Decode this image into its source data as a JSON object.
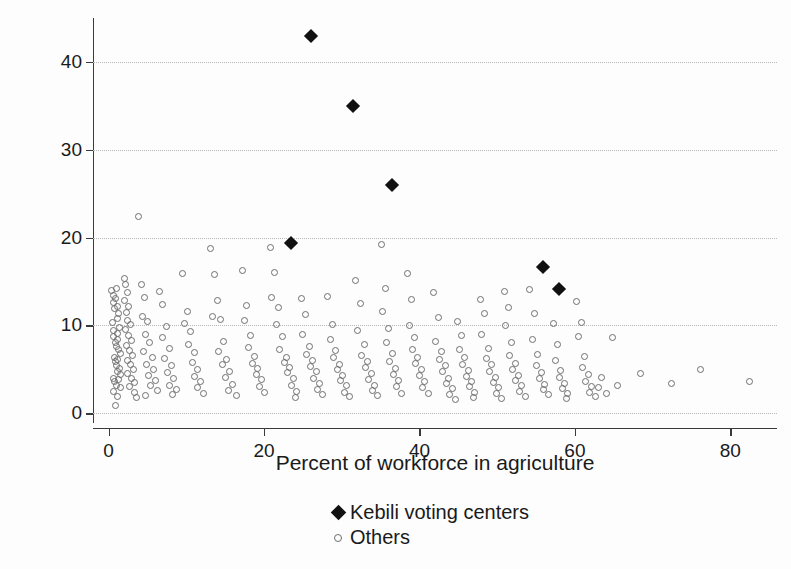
{
  "chart_data": {
    "type": "scatter",
    "title": "",
    "xlabel": "Percent of workforce in agriculture",
    "ylabel": "Percent voting for CPR",
    "xlim": [
      -2,
      86
    ],
    "ylim": [
      -1,
      45
    ],
    "xticks": [
      0,
      20,
      40,
      60,
      80
    ],
    "yticks": [
      0,
      10,
      20,
      30,
      40
    ],
    "grid": "horizontal-dotted",
    "legend_position": "bottom-center",
    "series": [
      {
        "name": "Kebili voting centers",
        "marker": "filled-diamond",
        "color": "#111111",
        "points": [
          [
            26.0,
            43.0
          ],
          [
            31.4,
            35.0
          ],
          [
            36.5,
            26.0
          ],
          [
            23.5,
            19.4
          ],
          [
            55.9,
            16.7
          ],
          [
            58.0,
            14.1
          ]
        ]
      },
      {
        "name": "Others",
        "marker": "open-circle",
        "color": "#6e6e6e",
        "points": [
          [
            3.9,
            22.4
          ],
          [
            0.4,
            14.0
          ],
          [
            0.6,
            13.4
          ],
          [
            0.7,
            12.6
          ],
          [
            0.8,
            11.9
          ],
          [
            0.9,
            13.1
          ],
          [
            1.0,
            14.2
          ],
          [
            1.1,
            12.1
          ],
          [
            1.2,
            10.8
          ],
          [
            1.3,
            11.4
          ],
          [
            1.4,
            9.8
          ],
          [
            0.5,
            10.3
          ],
          [
            0.6,
            9.4
          ],
          [
            0.7,
            8.7
          ],
          [
            0.9,
            8.1
          ],
          [
            1.0,
            7.6
          ],
          [
            1.1,
            9.1
          ],
          [
            1.2,
            8.4
          ],
          [
            1.3,
            7.2
          ],
          [
            1.5,
            6.8
          ],
          [
            0.8,
            6.4
          ],
          [
            0.9,
            5.9
          ],
          [
            1.0,
            5.4
          ],
          [
            1.1,
            6.1
          ],
          [
            1.2,
            4.8
          ],
          [
            1.4,
            5.1
          ],
          [
            1.6,
            4.4
          ],
          [
            0.6,
            4.0
          ],
          [
            0.8,
            3.6
          ],
          [
            1.0,
            3.2
          ],
          [
            1.3,
            3.8
          ],
          [
            1.5,
            2.9
          ],
          [
            0.7,
            2.5
          ],
          [
            1.1,
            1.9
          ],
          [
            0.9,
            0.9
          ],
          [
            2.0,
            15.3
          ],
          [
            2.2,
            14.6
          ],
          [
            2.4,
            13.8
          ],
          [
            2.1,
            12.8
          ],
          [
            2.6,
            12.2
          ],
          [
            2.3,
            11.5
          ],
          [
            2.5,
            10.6
          ],
          [
            2.8,
            10.1
          ],
          [
            2.2,
            9.5
          ],
          [
            2.6,
            8.9
          ],
          [
            2.9,
            8.3
          ],
          [
            2.3,
            7.7
          ],
          [
            2.7,
            7.1
          ],
          [
            3.1,
            6.6
          ],
          [
            2.4,
            6.0
          ],
          [
            2.8,
            5.5
          ],
          [
            3.2,
            5.0
          ],
          [
            2.5,
            4.5
          ],
          [
            3.0,
            4.0
          ],
          [
            3.4,
            3.5
          ],
          [
            2.7,
            3.0
          ],
          [
            3.3,
            2.4
          ],
          [
            3.6,
            1.8
          ],
          [
            4.2,
            14.6
          ],
          [
            4.6,
            13.2
          ],
          [
            4.4,
            11.0
          ],
          [
            5.0,
            10.4
          ],
          [
            4.8,
            9.0
          ],
          [
            5.3,
            8.1
          ],
          [
            4.5,
            7.0
          ],
          [
            5.6,
            6.3
          ],
          [
            4.9,
            5.6
          ],
          [
            5.8,
            5.0
          ],
          [
            5.1,
            4.3
          ],
          [
            6.0,
            3.7
          ],
          [
            5.4,
            3.1
          ],
          [
            6.3,
            2.6
          ],
          [
            4.7,
            2.0
          ],
          [
            6.6,
            13.9
          ],
          [
            7.0,
            12.4
          ],
          [
            7.4,
            9.9
          ],
          [
            6.9,
            8.6
          ],
          [
            7.8,
            7.4
          ],
          [
            7.2,
            6.2
          ],
          [
            8.1,
            5.4
          ],
          [
            7.6,
            4.6
          ],
          [
            8.4,
            3.9
          ],
          [
            7.9,
            3.2
          ],
          [
            8.8,
            2.7
          ],
          [
            8.2,
            2.1
          ],
          [
            9.5,
            15.9
          ],
          [
            10.1,
            11.6
          ],
          [
            9.8,
            10.2
          ],
          [
            10.6,
            9.3
          ],
          [
            10.3,
            7.8
          ],
          [
            11.0,
            6.9
          ],
          [
            10.8,
            5.8
          ],
          [
            11.4,
            5.0
          ],
          [
            11.1,
            4.2
          ],
          [
            11.8,
            3.6
          ],
          [
            11.5,
            2.9
          ],
          [
            12.2,
            2.3
          ],
          [
            13.1,
            18.8
          ],
          [
            13.6,
            15.8
          ],
          [
            14.0,
            12.8
          ],
          [
            13.4,
            11.0
          ],
          [
            14.4,
            10.7
          ],
          [
            14.8,
            8.2
          ],
          [
            14.2,
            7.0
          ],
          [
            15.2,
            6.1
          ],
          [
            14.6,
            5.6
          ],
          [
            15.6,
            4.8
          ],
          [
            15.0,
            4.1
          ],
          [
            16.0,
            3.3
          ],
          [
            15.4,
            2.6
          ],
          [
            16.4,
            2.0
          ],
          [
            17.2,
            16.2
          ],
          [
            17.8,
            12.3
          ],
          [
            17.5,
            10.6
          ],
          [
            18.3,
            8.9
          ],
          [
            18.0,
            7.5
          ],
          [
            18.8,
            6.5
          ],
          [
            18.5,
            5.7
          ],
          [
            19.2,
            5.1
          ],
          [
            19.0,
            4.4
          ],
          [
            19.7,
            3.8
          ],
          [
            19.4,
            3.0
          ],
          [
            20.1,
            2.4
          ],
          [
            20.8,
            18.9
          ],
          [
            21.4,
            16.0
          ],
          [
            21.0,
            13.2
          ],
          [
            21.9,
            12.0
          ],
          [
            21.6,
            10.1
          ],
          [
            22.4,
            8.7
          ],
          [
            22.0,
            7.3
          ],
          [
            22.9,
            6.4
          ],
          [
            22.6,
            5.8
          ],
          [
            23.3,
            5.2
          ],
          [
            23.0,
            4.6
          ],
          [
            23.8,
            3.9
          ],
          [
            23.5,
            3.2
          ],
          [
            24.2,
            2.5
          ],
          [
            24.0,
            1.8
          ],
          [
            24.8,
            13.1
          ],
          [
            25.3,
            11.2
          ],
          [
            25.0,
            9.0
          ],
          [
            25.8,
            7.6
          ],
          [
            25.5,
            6.7
          ],
          [
            26.2,
            6.0
          ],
          [
            26.0,
            5.3
          ],
          [
            26.7,
            4.7
          ],
          [
            26.4,
            4.0
          ],
          [
            27.1,
            3.4
          ],
          [
            26.9,
            2.7
          ],
          [
            27.5,
            2.1
          ],
          [
            28.2,
            13.3
          ],
          [
            28.8,
            10.1
          ],
          [
            28.5,
            8.4
          ],
          [
            29.2,
            7.1
          ],
          [
            29.0,
            6.3
          ],
          [
            29.7,
            5.6
          ],
          [
            29.4,
            5.0
          ],
          [
            30.1,
            4.3
          ],
          [
            29.9,
            3.7
          ],
          [
            30.6,
            3.1
          ],
          [
            30.3,
            2.4
          ],
          [
            31.0,
            1.9
          ],
          [
            31.8,
            15.1
          ],
          [
            32.4,
            12.5
          ],
          [
            32.0,
            9.4
          ],
          [
            32.9,
            7.8
          ],
          [
            32.6,
            6.6
          ],
          [
            33.3,
            5.9
          ],
          [
            33.0,
            5.2
          ],
          [
            33.8,
            4.5
          ],
          [
            33.5,
            3.8
          ],
          [
            34.2,
            3.2
          ],
          [
            33.9,
            2.6
          ],
          [
            34.6,
            2.0
          ],
          [
            35.1,
            19.2
          ],
          [
            35.6,
            14.2
          ],
          [
            35.3,
            11.6
          ],
          [
            36.0,
            9.6
          ],
          [
            35.8,
            8.0
          ],
          [
            36.5,
            6.8
          ],
          [
            36.2,
            5.9
          ],
          [
            36.9,
            5.1
          ],
          [
            36.6,
            4.4
          ],
          [
            37.3,
            3.7
          ],
          [
            37.0,
            3.0
          ],
          [
            37.7,
            2.3
          ],
          [
            38.4,
            15.9
          ],
          [
            39.0,
            12.9
          ],
          [
            38.7,
            10.0
          ],
          [
            39.4,
            8.6
          ],
          [
            39.1,
            7.3
          ],
          [
            39.8,
            6.4
          ],
          [
            39.5,
            5.7
          ],
          [
            40.2,
            5.0
          ],
          [
            40.0,
            4.3
          ],
          [
            40.7,
            3.6
          ],
          [
            40.4,
            2.9
          ],
          [
            41.1,
            2.2
          ],
          [
            41.8,
            13.8
          ],
          [
            42.4,
            10.9
          ],
          [
            42.0,
            8.2
          ],
          [
            42.9,
            7.0
          ],
          [
            42.6,
            6.1
          ],
          [
            43.3,
            5.4
          ],
          [
            43.0,
            4.7
          ],
          [
            43.8,
            4.0
          ],
          [
            43.5,
            3.4
          ],
          [
            44.2,
            2.8
          ],
          [
            43.9,
            2.1
          ],
          [
            44.6,
            1.6
          ],
          [
            44.9,
            10.4
          ],
          [
            45.4,
            8.8
          ],
          [
            45.1,
            7.2
          ],
          [
            45.8,
            6.3
          ],
          [
            45.6,
            5.5
          ],
          [
            46.3,
            4.9
          ],
          [
            46.0,
            4.2
          ],
          [
            46.7,
            3.6
          ],
          [
            46.4,
            3.0
          ],
          [
            47.1,
            2.4
          ],
          [
            46.9,
            1.8
          ],
          [
            47.8,
            13.0
          ],
          [
            48.4,
            11.3
          ],
          [
            48.0,
            9.0
          ],
          [
            48.9,
            7.4
          ],
          [
            48.6,
            6.2
          ],
          [
            49.3,
            5.5
          ],
          [
            49.0,
            4.8
          ],
          [
            49.8,
            4.1
          ],
          [
            49.5,
            3.5
          ],
          [
            50.2,
            2.9
          ],
          [
            49.9,
            2.2
          ],
          [
            50.6,
            1.7
          ],
          [
            50.9,
            13.9
          ],
          [
            51.4,
            12.0
          ],
          [
            51.1,
            10.0
          ],
          [
            51.8,
            8.0
          ],
          [
            51.6,
            6.6
          ],
          [
            52.3,
            5.7
          ],
          [
            52.0,
            5.0
          ],
          [
            52.7,
            4.3
          ],
          [
            52.4,
            3.7
          ],
          [
            53.1,
            3.1
          ],
          [
            52.9,
            2.5
          ],
          [
            53.6,
            1.9
          ],
          [
            54.2,
            14.1
          ],
          [
            54.8,
            11.4
          ],
          [
            54.5,
            8.4
          ],
          [
            55.2,
            6.7
          ],
          [
            55.0,
            5.4
          ],
          [
            55.7,
            4.6
          ],
          [
            55.4,
            3.9
          ],
          [
            56.1,
            3.3
          ],
          [
            55.9,
            2.7
          ],
          [
            56.6,
            2.1
          ],
          [
            57.2,
            10.2
          ],
          [
            57.8,
            7.8
          ],
          [
            57.5,
            6.0
          ],
          [
            58.2,
            4.9
          ],
          [
            58.0,
            4.1
          ],
          [
            58.7,
            3.4
          ],
          [
            58.4,
            2.8
          ],
          [
            59.1,
            2.2
          ],
          [
            58.9,
            1.7
          ],
          [
            60.2,
            12.7
          ],
          [
            60.8,
            10.3
          ],
          [
            60.5,
            8.7
          ],
          [
            61.2,
            6.5
          ],
          [
            61.0,
            5.2
          ],
          [
            61.7,
            4.4
          ],
          [
            61.4,
            3.6
          ],
          [
            62.1,
            3.0
          ],
          [
            61.9,
            2.4
          ],
          [
            62.6,
            1.9
          ],
          [
            63.4,
            4.1
          ],
          [
            63.0,
            2.9
          ],
          [
            64.1,
            2.2
          ],
          [
            64.8,
            8.6
          ],
          [
            65.5,
            3.2
          ],
          [
            68.5,
            4.5
          ],
          [
            72.4,
            3.4
          ],
          [
            76.2,
            5.0
          ],
          [
            82.5,
            3.6
          ]
        ]
      }
    ]
  },
  "axes": {
    "x_ticks": [
      "0",
      "20",
      "40",
      "60",
      "80"
    ],
    "y_ticks": [
      "0",
      "10",
      "20",
      "30",
      "40"
    ],
    "x_title": "Percent of workforce in agriculture",
    "y_title": "Percent voting for CPR"
  },
  "legend": {
    "entries": [
      {
        "label": "Kebili voting centers",
        "marker": "filled-diamond"
      },
      {
        "label": "Others",
        "marker": "open-circle"
      }
    ]
  }
}
